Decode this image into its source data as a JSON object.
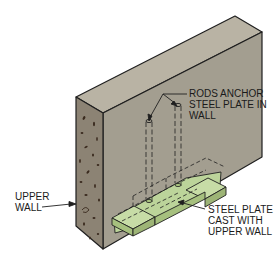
{
  "diagram": {
    "colors": {
      "wall_top": "#b9b3a4",
      "wall_front": "#a39e90",
      "wall_side": "#8c8374",
      "steel_plate": "#bcd49a",
      "outline": "#1f1f1f",
      "background": "#ffffff"
    },
    "labels": {
      "rods": [
        "RODS ANCHOR",
        "STEEL PLATE IN",
        "WALL"
      ],
      "upper_wall": [
        "UPPER",
        "WALL"
      ],
      "steel_plate": [
        "STEEL PLATE",
        "CAST WITH",
        "UPPER WALL"
      ]
    }
  }
}
